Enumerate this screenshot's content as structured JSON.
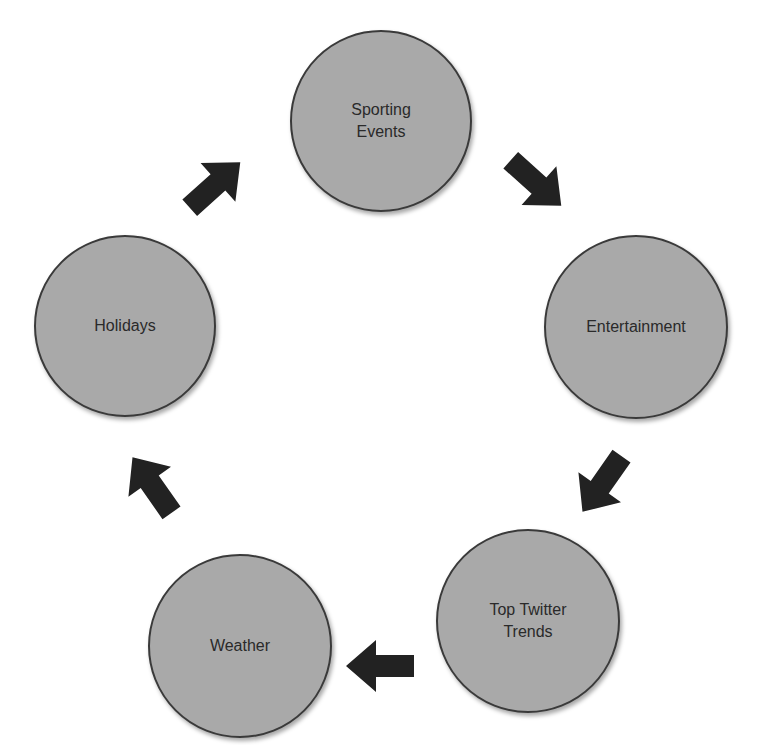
{
  "diagram": {
    "type": "cycle",
    "node_fill": "#a9a9a9",
    "node_border": "#3a3a3a",
    "arrow_color": "#222222",
    "nodes": [
      {
        "id": "sporting-events",
        "label": "Sporting\nEvents"
      },
      {
        "id": "entertainment",
        "label": "Entertainment"
      },
      {
        "id": "top-twitter-trends",
        "label": "Top Twitter\nTrends"
      },
      {
        "id": "weather",
        "label": "Weather"
      },
      {
        "id": "holidays",
        "label": "Holidays"
      }
    ],
    "edges": [
      {
        "from": "sporting-events",
        "to": "entertainment"
      },
      {
        "from": "entertainment",
        "to": "top-twitter-trends"
      },
      {
        "from": "top-twitter-trends",
        "to": "weather"
      },
      {
        "from": "weather",
        "to": "holidays"
      },
      {
        "from": "holidays",
        "to": "sporting-events"
      }
    ]
  }
}
